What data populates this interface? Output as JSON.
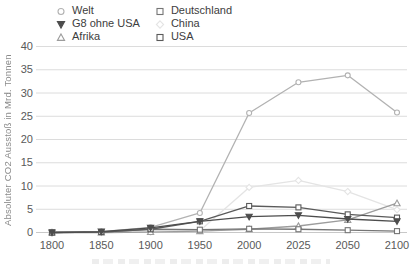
{
  "chart_data": {
    "type": "line",
    "title": "",
    "xlabel": "",
    "ylabel": "Absoluter CO2 Ausstoß in Mrd. Tonnen",
    "categories": [
      "1800",
      "1850",
      "1900",
      "1950",
      "2000",
      "2025",
      "2050",
      "2100"
    ],
    "yticks": [
      0,
      5,
      10,
      15,
      20,
      25,
      30,
      35,
      40
    ],
    "ylim": [
      0,
      40
    ],
    "grid": "horizontal",
    "legend_position": "top",
    "series": [
      {
        "name": "Welt",
        "marker": "circle",
        "filled": false,
        "color": "#b2b2b2",
        "values": [
          0.0,
          0.2,
          1.1,
          4.2,
          25.7,
          32.3,
          33.8,
          25.8
        ]
      },
      {
        "name": "G8 ohne USA",
        "marker": "triangle-down",
        "filled": true,
        "color": "#4d4d4d",
        "values": [
          0.0,
          0.2,
          1.0,
          2.4,
          3.4,
          3.7,
          2.9,
          2.4
        ]
      },
      {
        "name": "Afrika",
        "marker": "triangle-up",
        "filled": false,
        "color": "#9c9c9c",
        "values": [
          0.0,
          0.0,
          0.1,
          0.3,
          0.7,
          1.4,
          2.7,
          6.3
        ]
      },
      {
        "name": "Deutschland",
        "marker": "square",
        "filled": false,
        "color": "#757575",
        "values": [
          0.0,
          0.1,
          0.7,
          0.6,
          0.8,
          0.7,
          0.5,
          0.3
        ]
      },
      {
        "name": "China",
        "marker": "diamond",
        "filled": false,
        "color": "#e4e4e4",
        "values": [
          0.0,
          0.0,
          0.1,
          0.4,
          9.7,
          11.2,
          8.8,
          4.9
        ]
      },
      {
        "name": "USA",
        "marker": "square",
        "filled": false,
        "color": "#5a5a5a",
        "values": [
          0.0,
          0.1,
          0.7,
          2.4,
          5.7,
          5.4,
          3.9,
          3.2
        ]
      }
    ]
  },
  "colors": {
    "grid": "#dcdcdc",
    "zero_line": "#c8c8c8",
    "tick_text": "#595959",
    "legend_text": "#3d3d3d",
    "axis_title_text": "#8a8a8a",
    "background": "#ffffff"
  }
}
